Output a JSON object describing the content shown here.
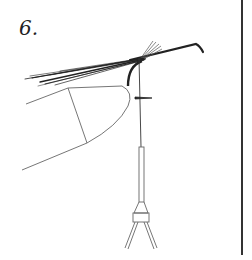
{
  "figure": {
    "step_number": "6.",
    "elements": [
      "hook",
      "tail-fibers",
      "vise-jaws",
      "tying-thread",
      "bobbin-holder",
      "thread-wraps"
    ]
  },
  "colors": {
    "ink": "#222222",
    "line": "#555555",
    "background": "#ffffff"
  }
}
